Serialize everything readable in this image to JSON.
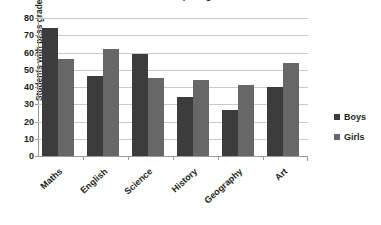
{
  "chart_data": {
    "type": "bar",
    "title": "Number of students with pass grades",
    "xlabel": "",
    "ylabel": "Students with pass grades (thousands)",
    "ylim": [
      0,
      80
    ],
    "ytick_step": 10,
    "yticks": [
      80,
      70,
      60,
      50,
      40,
      30,
      20,
      10,
      0
    ],
    "grid": true,
    "legend_position": "right",
    "categories": [
      "Maths",
      "English",
      "Science",
      "History",
      "Geography",
      "Art"
    ],
    "series": [
      {
        "name": "Boys",
        "color": "#3c3c3c",
        "values": [
          74,
          46.5,
          59,
          34,
          26.5,
          40
        ]
      },
      {
        "name": "Girls",
        "color": "#676767",
        "values": [
          56,
          62,
          45,
          44,
          41,
          54
        ]
      }
    ]
  }
}
